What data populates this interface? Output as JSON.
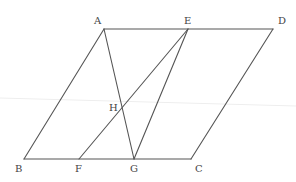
{
  "diagram": {
    "type": "geometry",
    "points": {
      "A": {
        "x": 104,
        "y": 29,
        "label": "A",
        "lx": 94,
        "ly": 24
      },
      "E": {
        "x": 188,
        "y": 29,
        "label": "E",
        "lx": 184,
        "ly": 24
      },
      "D": {
        "x": 273,
        "y": 29,
        "label": "D",
        "lx": 278,
        "ly": 24
      },
      "B": {
        "x": 24,
        "y": 159,
        "label": "B",
        "lx": 15,
        "ly": 172
      },
      "F": {
        "x": 79,
        "y": 159,
        "label": "F",
        "lx": 75,
        "ly": 172
      },
      "G": {
        "x": 134,
        "y": 159,
        "label": "G",
        "lx": 130,
        "ly": 172
      },
      "C": {
        "x": 191,
        "y": 159,
        "label": "C",
        "lx": 195,
        "ly": 172
      },
      "H": {
        "x": 124,
        "y": 108,
        "label": "H",
        "lx": 109,
        "ly": 111
      }
    },
    "segments": [
      [
        "A",
        "D"
      ],
      [
        "B",
        "C"
      ],
      [
        "A",
        "B"
      ],
      [
        "D",
        "C"
      ],
      [
        "A",
        "G"
      ],
      [
        "E",
        "F"
      ],
      [
        "E",
        "G"
      ]
    ],
    "line_color": "#555555",
    "label_color": "#444444"
  }
}
